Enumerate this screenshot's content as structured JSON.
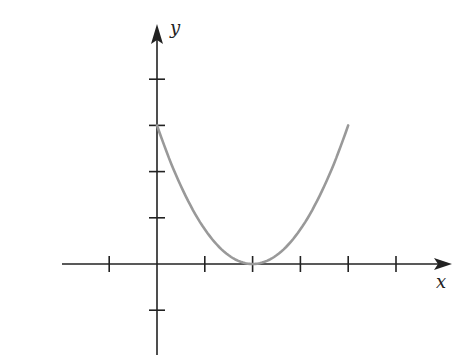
{
  "chart_data": {
    "type": "line",
    "title": "",
    "xlabel": "x",
    "ylabel": "y",
    "xlim": [
      -2,
      6
    ],
    "ylim": [
      -2,
      5
    ],
    "x_ticks": [
      -1,
      1,
      2,
      3,
      4,
      5
    ],
    "y_ticks": [
      -1,
      1,
      2,
      3,
      4
    ],
    "grid": false,
    "series": [
      {
        "name": "y = 3/4 (x - 2)^2",
        "color": "#999999",
        "x": [
          0,
          0.5,
          1,
          1.5,
          2,
          2.5,
          3,
          3.5,
          4
        ],
        "y": [
          3,
          1.6875,
          0.75,
          0.1875,
          0,
          0.1875,
          0.75,
          1.6875,
          3
        ]
      }
    ]
  },
  "axes": {
    "x_label": "x",
    "y_label": "y",
    "axis_color": "#222222"
  }
}
